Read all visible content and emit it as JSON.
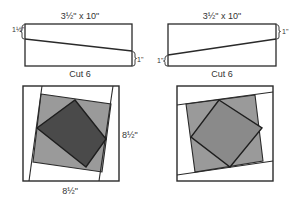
{
  "colors": {
    "outline": "#2a2a2a",
    "background": "#ffffff",
    "gray_light": "#9a9a9a",
    "gray_dark": "#4a4a4a",
    "gray_medium": "#8a8a8a",
    "label": "#333333"
  },
  "strips": [
    {
      "id": "left",
      "dimension": "3½\" x 10\"",
      "offset_left": "1½\"",
      "offset_right": "1\"",
      "cut_label": "Cut 6"
    },
    {
      "id": "right",
      "dimension": "3½\" x 10\"",
      "offset_left": "1\"",
      "offset_right": "1\"",
      "cut_label": "Cut 6"
    }
  ],
  "blocks": [
    {
      "id": "left",
      "height_label": "8½\"",
      "width_label": "8½\"",
      "center_shade": "dark"
    },
    {
      "id": "right",
      "center_shade": "medium"
    }
  ]
}
